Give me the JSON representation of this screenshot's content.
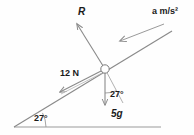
{
  "diagram": {
    "incline_angle": "27",
    "degree_symbol": "°",
    "labels": {
      "normal_reaction": "R",
      "acceleration": "a m/s²",
      "applied_force": "12 N",
      "weight": "5g",
      "angle_slope": "27°",
      "angle_base": "27°"
    },
    "colors": {
      "line": "#8a8a8a",
      "text": "#1a1a1a",
      "background": "#fefefe"
    },
    "geometry": {
      "node": {
        "x": 105,
        "y": 69,
        "r": 4
      },
      "incline": {
        "x1": 14,
        "y1": 127,
        "x2": 172,
        "y2": 31
      },
      "baseline": {
        "x1": 14,
        "y1": 127,
        "x2": 161,
        "y2": 127
      },
      "vector_R": {
        "x1": 105,
        "y1": 69,
        "x2": 76,
        "y2": 23
      },
      "vector_12N": {
        "x1": 105,
        "y1": 69,
        "x2": 58,
        "y2": 93
      },
      "vector_5g": {
        "x1": 105,
        "y1": 69,
        "x2": 105,
        "y2": 107
      },
      "vector_a": {
        "x1": 163,
        "y1": 25,
        "x2": 119,
        "y2": 42
      },
      "perp_helper": {
        "x1": 105,
        "y1": 69,
        "x2": 122,
        "y2": 101
      }
    }
  }
}
